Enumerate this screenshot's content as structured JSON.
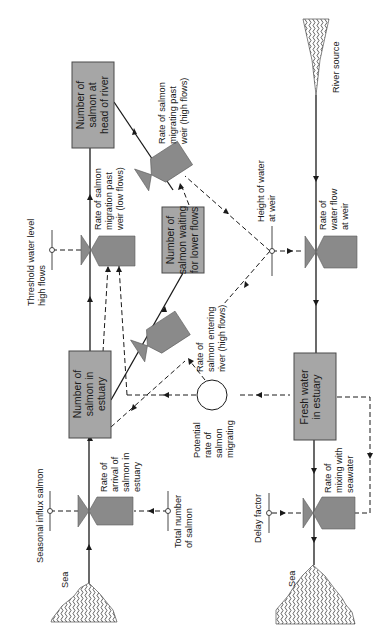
{
  "diagram": {
    "type": "system-dynamics flow diagram (rotated 90°)",
    "colors": {
      "stock_fill": "#a6a6a6",
      "valve_fill": "#8a8a8a",
      "line": "#1a1a1a"
    },
    "sources": {
      "sea_left": "Sea",
      "sea_right": "Sea",
      "river_source": "River source"
    },
    "stocks": {
      "head_of_river": [
        "Number of",
        "salmon at",
        "head of river"
      ],
      "waiting": [
        "Number of",
        "salmon waiting",
        "for lower flows"
      ],
      "estuary_salmon": [
        "Number of",
        "salmon in",
        "estuary"
      ],
      "fresh_water": [
        "Fresh water",
        "in estuary"
      ]
    },
    "rates": {
      "arrival": [
        "Rate of",
        "arrival of",
        "salmon in",
        "estuary"
      ],
      "low_flow_migration": [
        "Rate of salmon",
        "migration past",
        "weir (low flows)"
      ],
      "high_flow_migration": [
        "Rate of salmon",
        "migrating past",
        "weir (high flows)"
      ],
      "entering_river": [
        "Rate of",
        "salmon entering",
        "river (high flows)"
      ],
      "water_flow": [
        "Rate of",
        "water flow",
        "at weir"
      ],
      "mixing": [
        "Rate of",
        "mixing with",
        "seawater"
      ]
    },
    "auxiliaries": {
      "potential_rate": [
        "Potential",
        "rate of",
        "salmon",
        "migrating"
      ]
    },
    "parameters": {
      "seasonal_influx": "Seasonal influx salmon",
      "total_number": [
        "Total number",
        "of salmon"
      ],
      "threshold": [
        "Threshold water level",
        "high flows"
      ],
      "height_of_water": [
        "Height of water",
        "at weir"
      ],
      "delay_factor": "Delay factor"
    }
  }
}
